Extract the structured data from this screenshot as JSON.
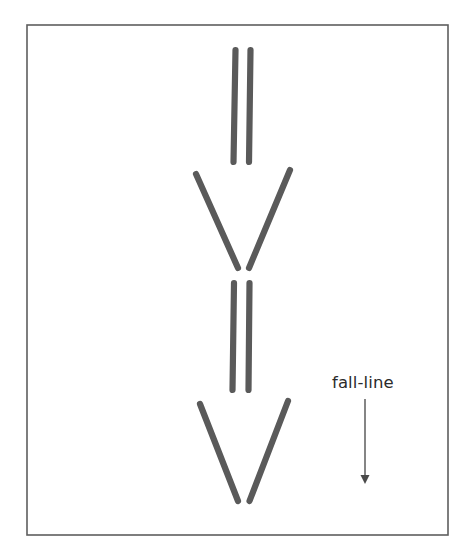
{
  "figure": {
    "kind": "ski-track-diagram",
    "caption_label": "fall-line",
    "background_color": "#ffffff",
    "frame": {
      "name": "diagram-border",
      "x": 27,
      "y": 25,
      "width": 421,
      "height": 510,
      "stroke_color": "#5e5e5e"
    },
    "track_color": "#5a5a5a",
    "track_width": 6.2,
    "label": {
      "text": "fall-line",
      "x": 332,
      "y": 388,
      "color": "#2b2b2b",
      "font_size": 16.5
    },
    "arrow": {
      "name": "fall-line-arrow",
      "direction": "down",
      "x": 365,
      "y_start": 399,
      "y_end": 475,
      "head_half_width": 4.5,
      "head_length": 9,
      "color": "#5c5c5c"
    },
    "groups": [
      {
        "name": "track-pair-1-parallel",
        "shape": "parallel",
        "lines": [
          {
            "x1": 235.5,
            "y1": 50,
            "x2": 233.5,
            "y2": 162
          },
          {
            "x1": 250.5,
            "y1": 50,
            "x2": 249.0,
            "y2": 162
          }
        ]
      },
      {
        "name": "track-pair-2-converging",
        "shape": "wedge",
        "lines": [
          {
            "x1": 196.0,
            "y1": 174,
            "x2": 238.0,
            "y2": 268
          },
          {
            "x1": 290.0,
            "y1": 170,
            "x2": 249.0,
            "y2": 268
          }
        ]
      },
      {
        "name": "track-pair-3-parallel",
        "shape": "parallel",
        "lines": [
          {
            "x1": 234.0,
            "y1": 283,
            "x2": 232.5,
            "y2": 390
          },
          {
            "x1": 249.5,
            "y1": 283,
            "x2": 248.5,
            "y2": 390
          }
        ]
      },
      {
        "name": "track-pair-4-converging",
        "shape": "wedge",
        "lines": [
          {
            "x1": 200.0,
            "y1": 404,
            "x2": 238.0,
            "y2": 501
          },
          {
            "x1": 288.0,
            "y1": 401,
            "x2": 249.5,
            "y2": 501
          }
        ]
      }
    ]
  }
}
